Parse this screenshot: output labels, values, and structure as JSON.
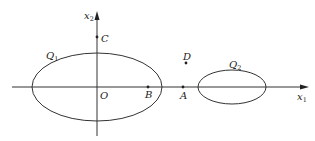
{
  "diagram": {
    "axes": {
      "x_axis": {
        "label": "x",
        "subscript": "1"
      },
      "y_axis": {
        "label": "x",
        "subscript": "2"
      },
      "origin": "O"
    },
    "regions": [
      {
        "name": "Q",
        "subscript": "1"
      },
      {
        "name": "Q",
        "subscript": "2"
      }
    ],
    "points": {
      "A": "A",
      "B": "B",
      "C": "C",
      "D": "D"
    },
    "colors": {
      "stroke": "#333333",
      "text": "#222222",
      "background": "#ffffff"
    }
  }
}
